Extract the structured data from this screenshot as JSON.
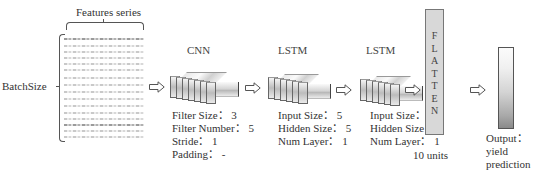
{
  "input": {
    "features_label": "Features series",
    "batch_label": "BatchSize",
    "series_count": 16
  },
  "layers": [
    {
      "name": "CNN",
      "params": [
        {
          "label": "Filter Size",
          "value": "3"
        },
        {
          "label": "Filter Number",
          "value": "5"
        },
        {
          "label": "Stride",
          "value": "1"
        },
        {
          "label": "Padding",
          "value": "-"
        }
      ]
    },
    {
      "name": "LSTM",
      "params": [
        {
          "label": "Input Size",
          "value": "5"
        },
        {
          "label": "Hidden Size",
          "value": "5"
        },
        {
          "label": "Num Layer",
          "value": "1"
        }
      ]
    },
    {
      "name": "LSTM",
      "params": [
        {
          "label": "Input Size",
          "value": "5"
        },
        {
          "label": "Hidden Size",
          "value": "5"
        },
        {
          "label": "Num Layer",
          "value": "1"
        }
      ]
    }
  ],
  "flatten": {
    "letters": [
      "F",
      "L",
      "A",
      "T",
      "T",
      "E",
      "N"
    ],
    "units_label": "10 units"
  },
  "output": {
    "line1": "Output：",
    "line2": "yield",
    "line3": "prediction"
  },
  "text": {
    "cnn_p0": "Filter Size： 3",
    "cnn_p1": "Filter Number： 5",
    "cnn_p2": "Stride： 1",
    "cnn_p3": "Padding： -",
    "lstm1_p0": "Input Size： 5",
    "lstm1_p1": "Hidden Size： 5",
    "lstm1_p2": "Num Layer： 1",
    "lstm2_p0": "Input Size： 5",
    "lstm2_p1": "Hidden Size： 5",
    "lstm2_p2": "Num Layer： 1"
  },
  "colors": {
    "line": "#555555",
    "flatten_fill": "#d8d8d8",
    "text": "#333333"
  }
}
